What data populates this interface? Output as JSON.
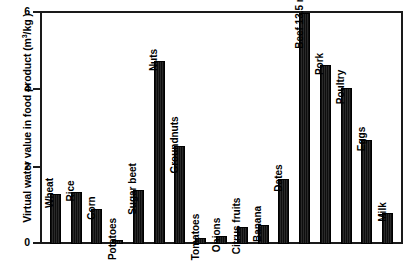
{
  "chart_data": {
    "type": "bar",
    "title": "",
    "xlabel": "",
    "ylabel": "Virtual water value in food product (m3/kg)",
    "ylabel_prefix": "Virtual water value in food product (m",
    "ylabel_superscript": "3",
    "ylabel_suffix": "/kg )",
    "ylim": [
      0,
      6
    ],
    "yticks": [
      0,
      2,
      4,
      6
    ],
    "ytick_labels": [
      "0",
      "2",
      "4",
      "6"
    ],
    "grid": false,
    "legend": "none",
    "bar_color": "#111111",
    "categories": [
      "Wheat",
      "Rice",
      "Corn",
      "Potatoes",
      "Sugar beet",
      "Nuts",
      "Groundnuts",
      "Tomatoes",
      "Onions",
      "Citrus fruits",
      "Banana",
      "Dates",
      "Beef",
      "Pork",
      "Poultry",
      "Eggs",
      "Milk"
    ],
    "values": [
      1.3,
      1.35,
      0.9,
      0.1,
      1.4,
      4.75,
      2.55,
      0.15,
      0.2,
      0.45,
      0.5,
      1.7,
      13.5,
      4.65,
      4.05,
      2.7,
      0.8
    ],
    "annotations": [
      {
        "category": "Beef",
        "text": "Beef 13.5 m3/kg",
        "note": "bar exceeds axis maximum and is clipped at top of plot"
      }
    ]
  },
  "bars": [
    {
      "label": "Wheat",
      "value": 1.3,
      "clipped": false
    },
    {
      "label": "Rice",
      "value": 1.35,
      "clipped": false
    },
    {
      "label": "Corn",
      "value": 0.9,
      "clipped": false
    },
    {
      "label": "Potatoes",
      "value": 0.1,
      "clipped": false
    },
    {
      "label": "Sugar beet",
      "value": 1.4,
      "clipped": false
    },
    {
      "label": "Nuts",
      "value": 4.75,
      "clipped": false
    },
    {
      "label": "Groundnuts",
      "value": 2.55,
      "clipped": false
    },
    {
      "label": "Tomatoes",
      "value": 0.15,
      "clipped": false
    },
    {
      "label": "Onions",
      "value": 0.2,
      "clipped": false
    },
    {
      "label": "Citrus fruits",
      "value": 0.45,
      "clipped": false
    },
    {
      "label": "Banana",
      "value": 0.5,
      "clipped": false
    },
    {
      "label": "Dates",
      "value": 1.7,
      "clipped": false
    },
    {
      "label": "Beef 13.5 m",
      "label_sup": "3",
      "label_tail": "/kg",
      "value": 13.5,
      "clipped": true
    },
    {
      "label": "Pork",
      "value": 4.65,
      "clipped": false
    },
    {
      "label": "Poultry",
      "value": 4.05,
      "clipped": false
    },
    {
      "label": "Eggs",
      "value": 2.7,
      "clipped": false
    },
    {
      "label": "Milk",
      "value": 0.8,
      "clipped": false
    }
  ]
}
